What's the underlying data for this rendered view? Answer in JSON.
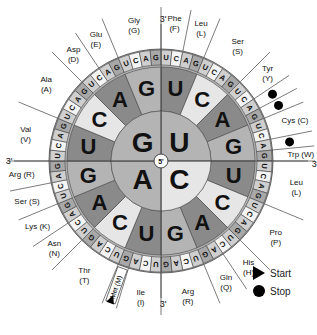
{
  "chart_data": {
    "type": "genetic-code-wheel",
    "center_label": "5'",
    "axis_end_label": "3'",
    "first_base": [
      {
        "base": "U",
        "quadrant": "top-right"
      },
      {
        "base": "C",
        "quadrant": "bottom-right"
      },
      {
        "base": "A",
        "quadrant": "bottom-left"
      },
      {
        "base": "G",
        "quadrant": "top-left"
      }
    ],
    "second_base_order": [
      "U",
      "C",
      "A",
      "G"
    ],
    "third_base_order": [
      "U",
      "C",
      "A",
      "G"
    ],
    "amino_acids": [
      {
        "label": "Phe\n(F)",
        "codons": [
          "UUU",
          "UUC"
        ]
      },
      {
        "label": "Leu\n(L)",
        "codons": [
          "UUA",
          "UUG"
        ]
      },
      {
        "label": "Ser\n(S)",
        "codons": [
          "UCU",
          "UCC",
          "UCA",
          "UCG"
        ]
      },
      {
        "label": "Tyr\n(Y)",
        "codons": [
          "UAU",
          "UAC"
        ]
      },
      {
        "label": "Stop",
        "codons": [
          "UAA"
        ]
      },
      {
        "label": "Stop",
        "codons": [
          "UAG"
        ]
      },
      {
        "label": "Cys (C)",
        "codons": [
          "UGU",
          "UGC"
        ]
      },
      {
        "label": "Stop",
        "codons": [
          "UGA"
        ]
      },
      {
        "label": "Trp (W)",
        "codons": [
          "UGG"
        ]
      },
      {
        "label": "Leu\n(L)",
        "codons": [
          "CUU",
          "CUC",
          "CUA",
          "CUG"
        ]
      },
      {
        "label": "Pro\n(P)",
        "codons": [
          "CCU",
          "CCC",
          "CCA",
          "CCG"
        ]
      },
      {
        "label": "His\n(H)",
        "codons": [
          "CAU",
          "CAC"
        ]
      },
      {
        "label": "Gln\n(Q)",
        "codons": [
          "CAA",
          "CAG"
        ]
      },
      {
        "label": "Arg\n(R)",
        "codons": [
          "CGU",
          "CGC",
          "CGA",
          "CGG"
        ]
      },
      {
        "label": "Ile\n(I)",
        "codons": [
          "AUU",
          "AUC",
          "AUA"
        ]
      },
      {
        "label": "Met (M)",
        "codons": [
          "AUG"
        ],
        "start": true
      },
      {
        "label": "Thr\n(T)",
        "codons": [
          "ACU",
          "ACC",
          "ACA",
          "ACG"
        ]
      },
      {
        "label": "Asn\n(N)",
        "codons": [
          "AAU",
          "AAC"
        ]
      },
      {
        "label": "Lys (K)",
        "codons": [
          "AAA",
          "AAG"
        ]
      },
      {
        "label": "Ser (S)",
        "codons": [
          "AGU",
          "AGC"
        ]
      },
      {
        "label": "Arg (R)",
        "codons": [
          "AGA",
          "AGG"
        ]
      },
      {
        "label": "Val\n(V)",
        "codons": [
          "GUU",
          "GUC",
          "GUA",
          "GUG"
        ]
      },
      {
        "label": "Ala\n(A)",
        "codons": [
          "GCU",
          "GCC",
          "GCA",
          "GCG"
        ]
      },
      {
        "label": "Asp\n(D)",
        "codons": [
          "GAU",
          "GAC"
        ]
      },
      {
        "label": "Glu\n(E)",
        "codons": [
          "GAA",
          "GAG"
        ]
      },
      {
        "label": "Gly\n(G)",
        "codons": [
          "GGU",
          "GGC",
          "GGA",
          "GGG"
        ]
      }
    ]
  },
  "legend": {
    "start_label": "Start",
    "stop_label": "Stop"
  },
  "colors": {
    "dark": "#8a8a8a",
    "mid": "#b4b4b4",
    "light": "#e6e6e6",
    "line": "#444444"
  }
}
